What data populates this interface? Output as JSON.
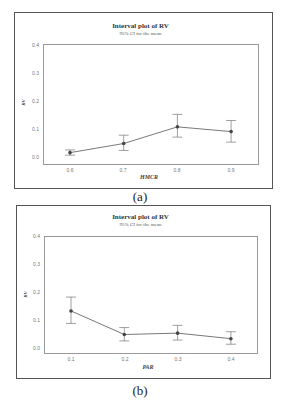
{
  "chart_data": [
    {
      "type": "line",
      "subtype": "interval_plot",
      "title": "Interval plot of RV",
      "subtitle": "95% CI for the mean",
      "xlabel": "HMCR",
      "ylabel": "RV",
      "categories": [
        "0.6",
        "0.7",
        "0.8",
        "0.9"
      ],
      "series": [
        {
          "name": "RV mean",
          "values": [
            0.012,
            0.045,
            0.105,
            0.088
          ],
          "ci_low": [
            0.003,
            0.02,
            0.068,
            0.05
          ],
          "ci_high": [
            0.022,
            0.075,
            0.15,
            0.128
          ]
        }
      ],
      "yticks": [
        "0.0",
        "0.1",
        "0.2",
        "0.3",
        "0.4"
      ],
      "ylim": [
        0.0,
        0.4
      ],
      "grid": false,
      "legend": "none",
      "caption": "(a)"
    },
    {
      "type": "line",
      "subtype": "interval_plot",
      "title": "Interval plot of RV",
      "subtitle": "95% CI for the mean",
      "xlabel": "PAR",
      "ylabel": "RV",
      "categories": [
        "0.1",
        "0.2",
        "0.3",
        "0.4"
      ],
      "series": [
        {
          "name": "RV mean",
          "values": [
            0.13,
            0.045,
            0.05,
            0.03
          ],
          "ci_low": [
            0.085,
            0.022,
            0.025,
            0.01
          ],
          "ci_high": [
            0.18,
            0.07,
            0.078,
            0.055
          ]
        }
      ],
      "yticks": [
        "0.0",
        "0.1",
        "0.2",
        "0.3",
        "0.4"
      ],
      "ylim": [
        0.0,
        0.4
      ],
      "grid": false,
      "legend": "none",
      "caption": "(b)"
    }
  ],
  "figures": [
    {
      "title": "Interval plot of RV",
      "subtitle": "95% CI for the mean",
      "xlabel": "HMCR",
      "ylabel": "RV",
      "yticks": [
        "0.4",
        "0.3",
        "0.2",
        "0.1",
        "0.0"
      ],
      "xticks": [
        "0.6",
        "0.7",
        "0.8",
        "0.9"
      ],
      "caption": "(a)"
    },
    {
      "title": "Interval plot of RV",
      "subtitle": "95% CI for the mean",
      "xlabel": "PAR",
      "ylabel": "RV",
      "yticks": [
        "0.4",
        "0.3",
        "0.2",
        "0.1",
        "0.0"
      ],
      "xticks": [
        "0.1",
        "0.2",
        "0.3",
        "0.4"
      ],
      "caption": "(b)"
    }
  ],
  "colors": {
    "line": "#555555",
    "marker": "#444444",
    "errorbar": "#777777",
    "frame": "#555555",
    "axis": "#999999"
  }
}
